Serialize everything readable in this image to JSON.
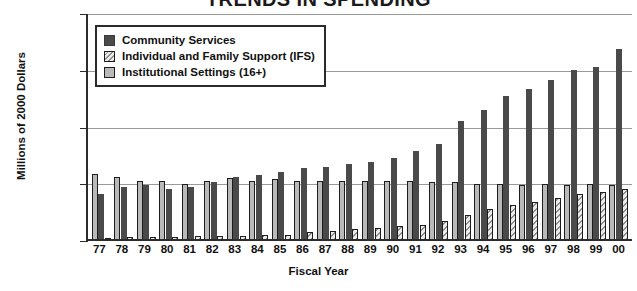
{
  "chart_data": {
    "type": "bar",
    "title": "TRENDS IN SPENDING",
    "xlabel": "Fiscal Year",
    "ylabel": "Millions of 2000 Dollars",
    "ylim": [
      0,
      80
    ],
    "yticks": [
      0,
      20,
      40,
      60,
      80
    ],
    "ytick_labels": [
      "$0",
      "$20",
      "$40",
      "$60",
      "$80"
    ],
    "grid": true,
    "legend_position": "top-left-inside",
    "categories": [
      "77",
      "78",
      "79",
      "80",
      "81",
      "82",
      "83",
      "84",
      "85",
      "86",
      "87",
      "88",
      "89",
      "90",
      "91",
      "92",
      "93",
      "94",
      "95",
      "96",
      "97",
      "98",
      "99",
      "00"
    ],
    "series": [
      {
        "name": "Institutional Settings (16+)",
        "color": "#b9b9b9",
        "values": [
          23.0,
          22.0,
          20.5,
          20.5,
          19.5,
          20.5,
          21.5,
          20.5,
          21.0,
          20.5,
          20.5,
          20.5,
          20.5,
          20.5,
          20.5,
          20.0,
          20.0,
          19.5,
          19.5,
          19.0,
          19.5,
          19.0,
          19.5,
          19.0
        ]
      },
      {
        "name": "Community Services",
        "color": "#4a4a4a",
        "values": [
          16.0,
          18.5,
          19.0,
          17.5,
          18.5,
          20.0,
          22.0,
          22.5,
          23.5,
          25.0,
          25.5,
          26.5,
          27.0,
          28.5,
          31.0,
          33.5,
          41.5,
          45.5,
          50.5,
          53.0,
          56.0,
          59.5,
          60.5,
          67.0
        ]
      },
      {
        "name": "Individual and Family Support (IFS)",
        "color": "#ececec",
        "values": [
          0.4,
          0.6,
          0.7,
          0.8,
          0.9,
          1.0,
          1.1,
          1.3,
          1.5,
          2.5,
          3.0,
          3.5,
          4.0,
          4.5,
          5.0,
          6.5,
          8.5,
          10.5,
          12.0,
          13.0,
          14.5,
          16.0,
          16.5,
          17.5
        ]
      }
    ]
  }
}
